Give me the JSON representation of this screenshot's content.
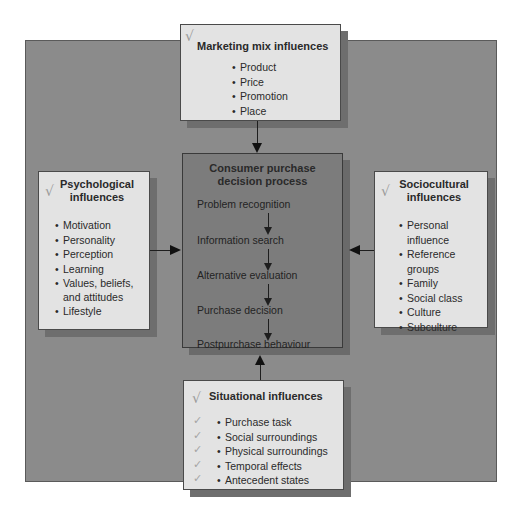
{
  "diagram": {
    "marketing": {
      "title": "Marketing mix influences",
      "items": [
        "Product",
        "Price",
        "Promotion",
        "Place"
      ]
    },
    "psychological": {
      "title_line1": "Psychological",
      "title_line2": "influences",
      "items": [
        "Motivation",
        "Personality",
        "Perception",
        "Learning",
        "Values, beliefs,",
        "and attitudes",
        "Lifestyle"
      ]
    },
    "sociocultural": {
      "title_line1": "Sociocultural",
      "title_line2": "influences",
      "items": [
        "Personal",
        "influence",
        "Reference",
        "groups",
        "Family",
        "Social class",
        "Culture",
        "Subculture"
      ]
    },
    "process": {
      "title_line1": "Consumer purchase",
      "title_line2": "decision process",
      "steps": [
        "Problem recognition",
        "Information search",
        "Alternative evaluation",
        "Purchase decision",
        "Postpurchase behaviour"
      ]
    },
    "situational": {
      "title": "Situational influences",
      "items": [
        "Purchase task",
        "Social surroundings",
        "Physical surroundings",
        "Temporal effects",
        "Antecedent states"
      ]
    },
    "icons": {
      "check": "√",
      "small_check": "✓"
    },
    "colors": {
      "panel": "#8b8b8b",
      "box": "#e3e3e3",
      "center_box": "#7c7c7c"
    }
  }
}
